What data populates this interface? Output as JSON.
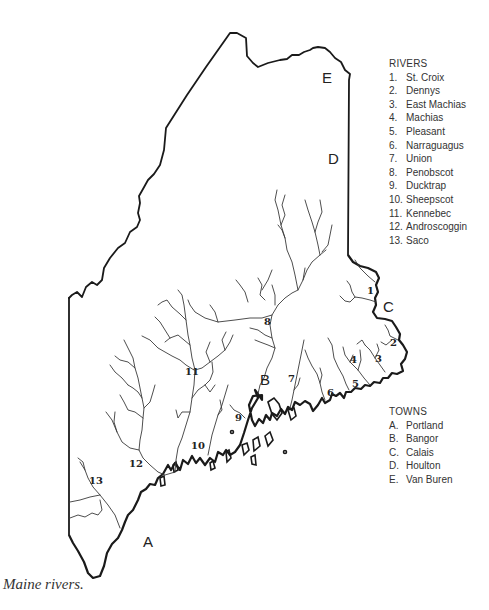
{
  "caption": "Maine rivers.",
  "rivers_legend": {
    "title": "RIVERS",
    "items": [
      {
        "key": "1.",
        "label": "St. Croix"
      },
      {
        "key": "2.",
        "label": "Dennys"
      },
      {
        "key": "3.",
        "label": "East Machias"
      },
      {
        "key": "4.",
        "label": "Machias"
      },
      {
        "key": "5.",
        "label": "Pleasant"
      },
      {
        "key": "6.",
        "label": "Narraguagus"
      },
      {
        "key": "7.",
        "label": "Union"
      },
      {
        "key": "8.",
        "label": "Penobscot"
      },
      {
        "key": "9.",
        "label": "Ducktrap"
      },
      {
        "key": "10.",
        "label": "Sheepscot"
      },
      {
        "key": "11.",
        "label": "Kennebec"
      },
      {
        "key": "12.",
        "label": "Androscoggin"
      },
      {
        "key": "13.",
        "label": "Saco"
      }
    ]
  },
  "towns_legend": {
    "title": "TOWNS",
    "items": [
      {
        "key": "A.",
        "label": "Portland"
      },
      {
        "key": "B.",
        "label": "Bangor"
      },
      {
        "key": "C.",
        "label": "Calais"
      },
      {
        "key": "D.",
        "label": "Houlton"
      },
      {
        "key": "E.",
        "label": "Van Buren"
      }
    ]
  },
  "map_labels": {
    "rivers": [
      "1",
      "2",
      "3",
      "4",
      "5",
      "6",
      "7",
      "8",
      "9",
      "10",
      "11",
      "12",
      "13"
    ],
    "towns": [
      "A",
      "B",
      "C",
      "D",
      "E"
    ]
  }
}
